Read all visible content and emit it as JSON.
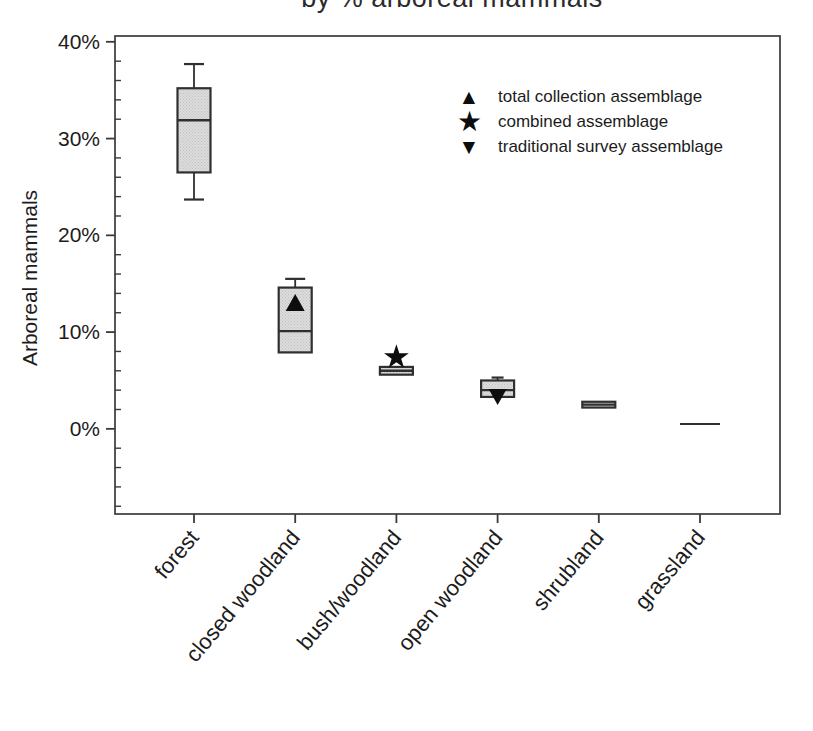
{
  "chart_data": {
    "type": "box",
    "title": "by % arboreal mammals",
    "title_note": "title partially cut off at top edge of image",
    "ylabel": "Arboreal mammals",
    "xlabel": "",
    "ylim": [
      -8.8,
      40.6
    ],
    "y_minor_step": 2,
    "y_ticks": [
      {
        "value": 0,
        "label": "0%"
      },
      {
        "value": 10,
        "label": "10%"
      },
      {
        "value": 20,
        "label": "20%"
      },
      {
        "value": 30,
        "label": "30%"
      },
      {
        "value": 40,
        "label": "40%"
      }
    ],
    "categories": [
      "forest",
      "closed woodland",
      "bush/woodland",
      "open woodland",
      "shrubland",
      "grassland"
    ],
    "boxes": [
      {
        "category": "forest",
        "whisker_low": 23.7,
        "q1": 26.5,
        "median": 31.9,
        "q3": 35.2,
        "whisker_high": 37.7
      },
      {
        "category": "closed woodland",
        "whisker_low": null,
        "q1": 7.9,
        "median": 10.1,
        "q3": 14.6,
        "whisker_high": 15.5
      },
      {
        "category": "bush/woodland",
        "whisker_low": null,
        "q1": 5.6,
        "median": 6.0,
        "q3": 6.4,
        "whisker_high": null
      },
      {
        "category": "open woodland",
        "whisker_low": null,
        "q1": 3.3,
        "median": 4.0,
        "q3": 5.0,
        "whisker_high": 5.3
      },
      {
        "category": "shrubland",
        "whisker_low": null,
        "q1": 2.2,
        "median": 2.5,
        "q3": 2.8,
        "whisker_high": null
      },
      {
        "category": "grassland",
        "whisker_low": null,
        "q1": 0.5,
        "median": 0.5,
        "q3": 0.5,
        "whisker_high": null
      }
    ],
    "markers": [
      {
        "category": "closed woodland",
        "symbol": "triangle-up",
        "value": 13.0,
        "label": "total collection assemblage"
      },
      {
        "category": "bush/woodland",
        "symbol": "star",
        "value": 7.4,
        "label": "combined assemblage"
      },
      {
        "category": "open woodland",
        "symbol": "triangle-down",
        "value": 3.4,
        "label": "traditional survey assemblage"
      }
    ],
    "legend": [
      {
        "symbol": "triangle-up",
        "glyph": "▲",
        "label": "total collection assemblage"
      },
      {
        "symbol": "star",
        "glyph": "★",
        "label": "combined assemblage"
      },
      {
        "symbol": "triangle-down",
        "glyph": "▼",
        "label": "traditional survey assemblage"
      }
    ],
    "legend_position": "upper-right-inside",
    "grid": false,
    "colors": {
      "box_fill": "#dcdcdc",
      "box_dot": "#c2c2c2",
      "box_stroke": "#2f2f2f",
      "axis": "#3a3a3a",
      "marker": "#0d0d0d",
      "text": "#1c1c1c"
    }
  }
}
